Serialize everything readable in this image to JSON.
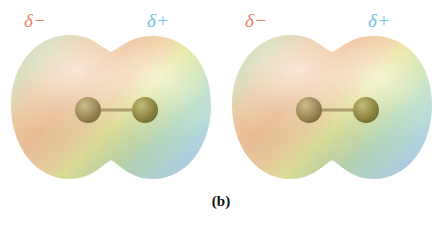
{
  "figure": {
    "caption": "(b)",
    "background_color": "#ffffff",
    "width": 442,
    "height": 231
  },
  "molecules": [
    {
      "id": "molecule-left",
      "delta_negative_label": "δ−",
      "delta_positive_label": "δ+",
      "delta_negative_color": "#e8836a",
      "delta_positive_color": "#72c0e4",
      "atoms": [
        {
          "name": "atom-left",
          "cx": 80,
          "cy": 77,
          "r": 13,
          "color": "#9a8a55"
        },
        {
          "name": "atom-right",
          "cx": 137,
          "cy": 77,
          "r": 13,
          "color": "#8e8742"
        }
      ],
      "bond": {
        "x1": 80,
        "y1": 77,
        "x2": 137,
        "y2": 77,
        "color": "#9f8f63"
      },
      "surface_colors": {
        "far_left": "#cfe0c0",
        "negative_lobe": "#f2c29c",
        "waist": "#e8eda0",
        "positive_lobe": "#bfe3c8",
        "far_right": "#b9d8ef",
        "edge_right": "#a9b7e2"
      }
    },
    {
      "id": "molecule-right",
      "delta_negative_label": "δ−",
      "delta_positive_label": "δ+",
      "delta_negative_color": "#e8836a",
      "delta_positive_color": "#72c0e4",
      "atoms": [
        {
          "name": "atom-left",
          "cx": 80,
          "cy": 77,
          "r": 13,
          "color": "#9a8a55"
        },
        {
          "name": "atom-right",
          "cx": 137,
          "cy": 77,
          "r": 13,
          "color": "#8e8742"
        }
      ],
      "bond": {
        "x1": 80,
        "y1": 77,
        "x2": 137,
        "y2": 77,
        "color": "#9f8f63"
      },
      "surface_colors": {
        "far_left": "#cfe0c0",
        "negative_lobe": "#f2c29c",
        "waist": "#e8eda0",
        "positive_lobe": "#bfe3c8",
        "far_right": "#b9d8ef",
        "edge_right": "#a9b7e2"
      }
    }
  ]
}
